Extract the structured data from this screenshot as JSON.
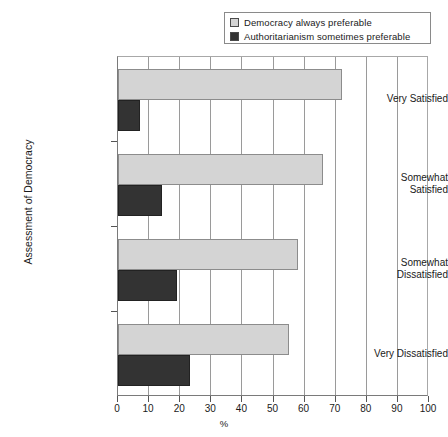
{
  "chart_data": {
    "type": "bar",
    "orientation": "horizontal",
    "title": "",
    "xlabel": "%",
    "ylabel": "Assessment of Democracy",
    "xlim": [
      0,
      100
    ],
    "xticks": [
      0,
      10,
      20,
      30,
      40,
      50,
      60,
      70,
      80,
      90,
      100
    ],
    "grid": true,
    "legend_position": "top-right",
    "categories": [
      "Very Satisfied",
      "Somewhat Satisfied",
      "Somewhat Dissatisfied",
      "Very Dissatisfied"
    ],
    "series": [
      {
        "name": "Democracy always preferable",
        "color": "#d4d4d4",
        "values": [
          72,
          66,
          58,
          55
        ]
      },
      {
        "name": "Authoritarianism sometimes preferable",
        "color": "#333333",
        "values": [
          7,
          14,
          19,
          23
        ]
      }
    ]
  },
  "legend": {
    "items": [
      {
        "label": "Democracy always preferable",
        "swatch": "#d4d4d4"
      },
      {
        "label": "Authoritarianism sometimes preferable",
        "swatch": "#333333"
      }
    ]
  },
  "axes": {
    "y_title": "Assessment of Democracy",
    "x_title": "%",
    "y_labels": [
      "Very Satisfied",
      "Somewhat\nSatisfied",
      "Somewhat\nDissatisfied",
      "Very Dissatisfied"
    ],
    "x_labels": [
      "0",
      "10",
      "20",
      "30",
      "40",
      "50",
      "60",
      "70",
      "80",
      "90",
      "100"
    ]
  }
}
